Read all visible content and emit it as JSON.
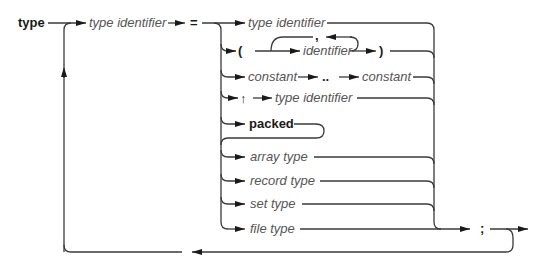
{
  "diagram": {
    "title": "type",
    "kind": "syntax-diagram",
    "entry": {
      "label": "type identifier",
      "style": "italic"
    },
    "equals": "=",
    "alternatives": [
      {
        "id": "type-identifier",
        "parts": [
          {
            "label": "type identifier",
            "style": "italic"
          }
        ]
      },
      {
        "id": "enumeration",
        "parts": [
          {
            "label": "(",
            "style": "bold"
          },
          {
            "label": "identifier",
            "style": "italic"
          },
          {
            "label": ",",
            "style": "bold",
            "loop": true
          },
          {
            "label": ")",
            "style": "bold"
          }
        ]
      },
      {
        "id": "subrange",
        "parts": [
          {
            "label": "constant",
            "style": "italic"
          },
          {
            "label": "..",
            "style": "bold"
          },
          {
            "label": "constant",
            "style": "italic"
          }
        ]
      },
      {
        "id": "pointer",
        "parts": [
          {
            "label": "↑",
            "style": "bold"
          },
          {
            "label": "type identifier",
            "style": "italic"
          }
        ]
      },
      {
        "id": "packed",
        "parts": [
          {
            "label": "packed",
            "style": "bold"
          }
        ]
      },
      {
        "id": "array",
        "parts": [
          {
            "label": "array type",
            "style": "italic"
          }
        ]
      },
      {
        "id": "record",
        "parts": [
          {
            "label": "record type",
            "style": "italic"
          }
        ]
      },
      {
        "id": "set",
        "parts": [
          {
            "label": "set type",
            "style": "italic"
          }
        ]
      },
      {
        "id": "file",
        "parts": [
          {
            "label": "file type",
            "style": "italic"
          }
        ]
      }
    ],
    "terminator": ";"
  },
  "labels": {
    "title": "type",
    "entry": "type identifier",
    "equals": "=",
    "alt_type_identifier": "type identifier",
    "open_paren": "(",
    "identifier": "identifier",
    "comma": ",",
    "close_paren": ")",
    "constant_1": "constant",
    "dots": "..",
    "constant_2": "constant",
    "pointer": "↑",
    "pointer_type_identifier": "type identifier",
    "packed": "packed",
    "array_type": "array type",
    "record_type": "record type",
    "set_type": "set type",
    "file_type": "file type",
    "semicolon": ";"
  }
}
